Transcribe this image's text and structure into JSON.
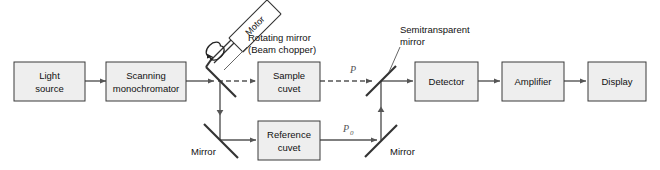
{
  "figure": {
    "background_color": "#ffffff",
    "box_fill_color": "#eeeeee",
    "box_border_color": "#3a3a3a",
    "beam_color": "#555555",
    "mirror_color": "#333333"
  },
  "blocks": [
    {
      "id": "light-source",
      "label_line1": "Light",
      "label_line2": "source"
    },
    {
      "id": "scanning-monochromator",
      "label_line1": "Scanning",
      "label_line2": "monochromator"
    },
    {
      "id": "sample-cuvet",
      "label_line1": "Sample",
      "label_line2": "cuvet"
    },
    {
      "id": "reference-cuvet",
      "label_line1": "Reference",
      "label_line2": "cuvet"
    },
    {
      "id": "detector",
      "label_line1": "Detector",
      "label_line2": ""
    },
    {
      "id": "amplifier",
      "label_line1": "Amplifier",
      "label_line2": ""
    },
    {
      "id": "display",
      "label_line1": "Display",
      "label_line2": ""
    }
  ],
  "annotations": {
    "motor": "Motor",
    "rotating_mirror_line1": "Rotating mirror",
    "rotating_mirror_line2": "(Beam chopper)",
    "semitransparent_mirror_line1": "Semitransparent",
    "semitransparent_mirror_line2": "mirror",
    "mirror_lower_left": "Mirror",
    "mirror_lower_right": "Mirror",
    "power_sample": "P",
    "power_reference": "P",
    "power_reference_subscript": "0"
  }
}
